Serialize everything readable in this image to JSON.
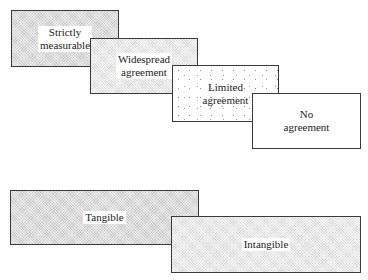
{
  "diagram": {
    "scale_row": {
      "boxes": [
        {
          "label": "Strictly\nmeasurable",
          "shading": "dense"
        },
        {
          "label": "Widespread\nagreement",
          "shading": "medium"
        },
        {
          "label": "Limited\nagreement",
          "shading": "sparse-dots"
        },
        {
          "label": "No\nagreement",
          "shading": "none"
        }
      ]
    },
    "tangibility_row": {
      "boxes": [
        {
          "label": "Tangible",
          "shading": "dense"
        },
        {
          "label": "Intangible",
          "shading": "medium"
        }
      ]
    }
  }
}
